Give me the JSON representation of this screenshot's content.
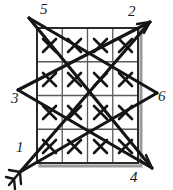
{
  "figure": {
    "type": "geometric-diagram",
    "canvas": {
      "width": 173,
      "height": 190
    },
    "ink_color": "#151515",
    "grid_line_color": "#4a4a4a",
    "shadow_color": "#9a9a9a",
    "background_color": "#ffffff"
  },
  "grid": {
    "rows": 4,
    "cols": 4,
    "left": 37,
    "top": 28,
    "right": 138,
    "bottom": 163,
    "cell_mark": "X",
    "marked_cells": [
      [
        "X",
        "X",
        "X",
        "X"
      ],
      [
        "X",
        "X",
        "X",
        "X"
      ],
      [
        "X",
        "X",
        "X",
        "X"
      ],
      [
        "X",
        "X",
        "X",
        "X"
      ]
    ]
  },
  "vertices": [
    {
      "id": "1",
      "label": "1",
      "x": 26,
      "y": 166,
      "label_x": 16,
      "label_y": 147,
      "arrow": "double-chevron-down-left"
    },
    {
      "id": "2",
      "label": "2",
      "x": 150,
      "y": 22,
      "label_x": 128,
      "label_y": 8,
      "arrow": "tip"
    },
    {
      "id": "3",
      "label": "3",
      "x": 18,
      "y": 90,
      "label_x": 12,
      "label_y": 96,
      "arrow": "none"
    },
    {
      "id": "4",
      "label": "4",
      "x": 152,
      "y": 168,
      "label_x": 131,
      "label_y": 172,
      "arrow": "tip"
    },
    {
      "id": "5",
      "label": "5",
      "x": 29,
      "y": 18,
      "label_x": 40,
      "label_y": 5,
      "arrow": "none"
    },
    {
      "id": "6",
      "label": "6",
      "x": 157,
      "y": 93,
      "label_x": 159,
      "label_y": 96,
      "arrow": "none"
    }
  ],
  "segments": [
    {
      "name": "seg-5-4",
      "from": "5",
      "to": "4"
    },
    {
      "name": "seg-5-6",
      "from": "5",
      "to": "6"
    },
    {
      "name": "seg-2-1",
      "from": "2",
      "to": "1"
    },
    {
      "name": "seg-2-3",
      "from": "2",
      "to": "3"
    },
    {
      "name": "seg-3-4",
      "from": "3",
      "to": "4"
    },
    {
      "name": "seg-6-1",
      "from": "6",
      "to": "1"
    }
  ]
}
